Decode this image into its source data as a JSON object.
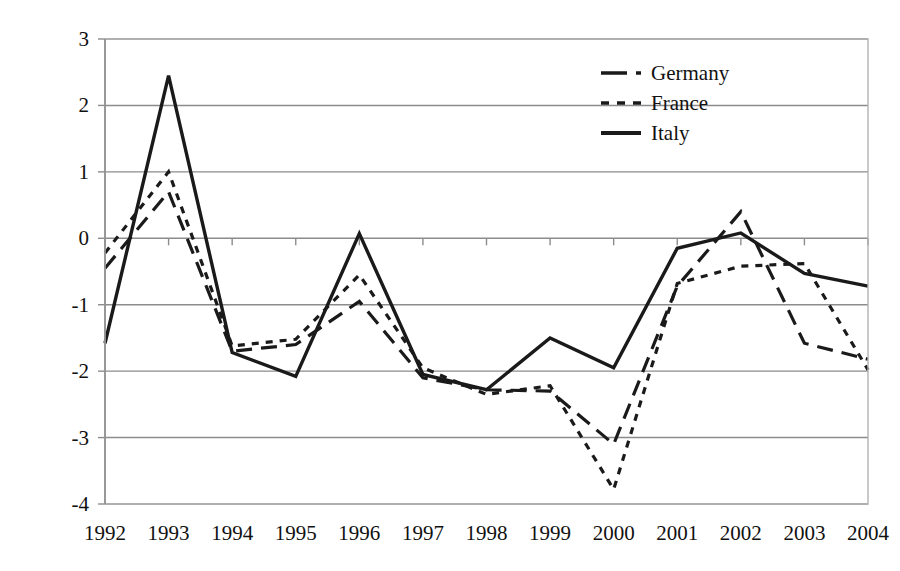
{
  "chart_data": {
    "type": "line",
    "title": "",
    "xlabel": "",
    "ylabel": "",
    "categories": [
      "1992",
      "1993",
      "1994",
      "1995",
      "1996",
      "1997",
      "1998",
      "1999",
      "2000",
      "2001",
      "2002",
      "2003",
      "2004"
    ],
    "x": [
      1992,
      1993,
      1994,
      1995,
      1996,
      1997,
      1998,
      1999,
      2000,
      2001,
      2002,
      2003,
      2004
    ],
    "xlim": [
      1992,
      2004
    ],
    "ylim": [
      -4,
      3
    ],
    "yticks": [
      3,
      2,
      1,
      0,
      -1,
      -2,
      -3,
      -4
    ],
    "ytick_labels": [
      "3",
      "2",
      "1",
      "0",
      "-1",
      "-2",
      "-3",
      "-4"
    ],
    "grid": true,
    "legend_position": "top-right",
    "series": [
      {
        "name": "Germany",
        "style": "dashed",
        "values": [
          -0.45,
          0.7,
          -1.7,
          -1.6,
          -0.95,
          -2.1,
          -2.28,
          -2.3,
          -3.1,
          -0.72,
          0.4,
          -1.58,
          -1.82
        ]
      },
      {
        "name": "France",
        "style": "dotted",
        "values": [
          -0.22,
          1.0,
          -1.62,
          -1.52,
          -0.55,
          -1.95,
          -2.35,
          -2.22,
          -3.78,
          -0.68,
          -0.42,
          -0.38,
          -1.98
        ]
      },
      {
        "name": "Italy",
        "style": "solid",
        "values": [
          -1.58,
          2.45,
          -1.72,
          -2.08,
          0.07,
          -2.05,
          -2.28,
          -1.5,
          -1.95,
          -0.15,
          0.08,
          -0.53,
          -0.72
        ]
      }
    ]
  },
  "legend": {
    "items": [
      {
        "label": "Germany",
        "style": "dashed"
      },
      {
        "label": "France",
        "style": "dotted"
      },
      {
        "label": "Italy",
        "style": "solid"
      }
    ]
  },
  "colors": {
    "series": "#1a1a1a",
    "grid": "#8c8c8c",
    "border": "#b3b3b3",
    "background": "#ffffff"
  }
}
